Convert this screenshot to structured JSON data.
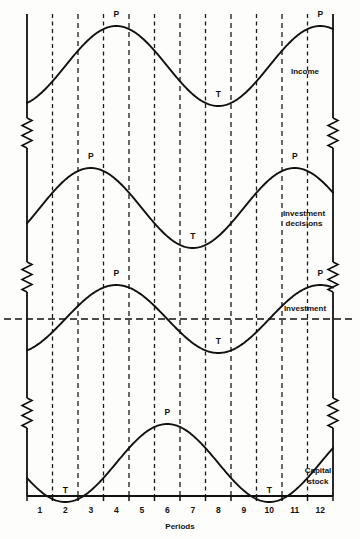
{
  "figure": {
    "xlabel": "Periods",
    "xticks": [
      "1",
      "2",
      "3",
      "4",
      "5",
      "6",
      "7",
      "8",
      "9",
      "10",
      "11",
      "12"
    ],
    "marker_peak": "P",
    "marker_trough": "T",
    "series_labels": {
      "income": "Income",
      "investment_decisions_line1": "Investment",
      "investment_decisions_line2": "decisions",
      "investment": "Investment",
      "capital_stock_line1": "Capital",
      "capital_stock_line2": "stock"
    },
    "colors": {
      "ink": "#111111",
      "paper": "#fdfdfb",
      "grid": "#1a1a1a"
    }
  },
  "chart_data": {
    "type": "line",
    "title": "",
    "xlabel": "Periods",
    "ylabel": "",
    "xlim": [
      0.5,
      12.5
    ],
    "grid": true,
    "gridlines_x": [
      1.5,
      2.5,
      3.5,
      4.5,
      5.5,
      6.5,
      7.5,
      8.5,
      9.5,
      10.5,
      11.5,
      12.5
    ],
    "x": [
      1,
      2,
      3,
      4,
      5,
      6,
      7,
      8,
      9,
      10,
      11,
      12
    ],
    "legend_position": "inline-right",
    "axis_breaks": [
      "left-axis",
      "right-axis"
    ],
    "zero_reference_line": {
      "panel": "Investment",
      "value": 0,
      "style": "dashed"
    },
    "series": [
      {
        "name": "Income",
        "panel": 1,
        "phase_period": 8,
        "peak_period": 4,
        "trough_period": 8,
        "annotations": [
          {
            "label": "P",
            "period": 4
          },
          {
            "label": "T",
            "period": 8
          },
          {
            "label": "P",
            "period": 12
          }
        ],
        "values": [
          -0.71,
          0.0,
          0.71,
          1.0,
          0.71,
          0.0,
          -0.71,
          -1.0,
          -0.71,
          0.0,
          0.71,
          1.0
        ]
      },
      {
        "name": "Investment decisions",
        "panel": 2,
        "phase_period": 8,
        "peak_period": 3,
        "trough_period": 7,
        "annotations": [
          {
            "label": "P",
            "period": 3
          },
          {
            "label": "T",
            "period": 7
          },
          {
            "label": "P",
            "period": 11
          }
        ],
        "values": [
          0.0,
          0.71,
          1.0,
          0.71,
          0.0,
          -0.71,
          -1.0,
          -0.71,
          0.0,
          0.71,
          1.0,
          0.71
        ]
      },
      {
        "name": "Investment",
        "panel": 3,
        "phase_period": 8,
        "peak_period": 4,
        "trough_period": 8,
        "annotations": [
          {
            "label": "P",
            "period": 4
          },
          {
            "label": "T",
            "period": 8
          },
          {
            "label": "P",
            "period": 12
          }
        ],
        "values": [
          -0.71,
          0.0,
          0.71,
          1.0,
          0.71,
          0.0,
          -0.71,
          -1.0,
          -0.71,
          0.0,
          0.71,
          1.0
        ]
      },
      {
        "name": "Capital stock",
        "panel": 4,
        "phase_period": 8,
        "peak_period": 6,
        "trough_period": 2,
        "annotations": [
          {
            "label": "T",
            "period": 2
          },
          {
            "label": "P",
            "period": 6
          },
          {
            "label": "T",
            "period": 10
          }
        ],
        "values": [
          -0.71,
          -1.0,
          -0.71,
          0.0,
          0.71,
          1.0,
          0.71,
          0.0,
          -0.71,
          -1.0,
          -0.71,
          0.0
        ]
      }
    ]
  }
}
